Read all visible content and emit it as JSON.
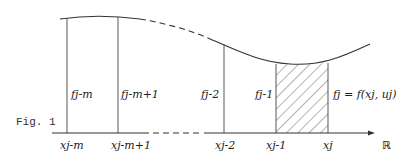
{
  "figure": {
    "caption": "Fig. 1",
    "axis_label": "ℝ",
    "x_labels": [
      "x_{j-m}",
      "x_{j-m+1}",
      "x_{j-2}",
      "x_{j-1}",
      "x_j"
    ],
    "x_labels_display": [
      "xj-m",
      "xj-m+1",
      "xj-2",
      "xj-1",
      "xj"
    ],
    "f_labels_display": [
      "fj-m",
      "fj-m+1",
      "fj-2",
      "fj-1",
      "fj = f(xj, uj)"
    ],
    "hatched_interval": [
      "x_{j-1}",
      "x_j"
    ],
    "line_color": "#333333"
  }
}
